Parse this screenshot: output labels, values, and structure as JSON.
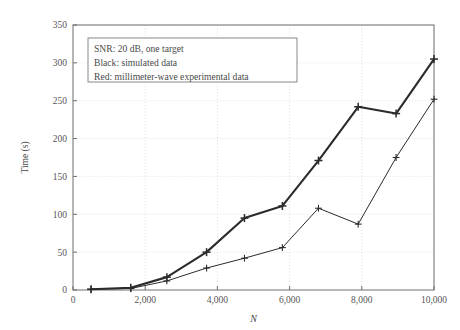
{
  "chart_data": {
    "type": "line",
    "title": "",
    "xlabel": "N",
    "ylabel": "Time (s)",
    "xlim": [
      0,
      10000
    ],
    "ylim": [
      0,
      350
    ],
    "xticks": [
      0,
      2000,
      4000,
      6000,
      8000,
      10000
    ],
    "xticklabels": [
      "0",
      "2,000",
      "4,000",
      "6,000",
      "8,000",
      "10,000"
    ],
    "yticks": [
      0,
      50,
      100,
      150,
      200,
      250,
      300,
      350
    ],
    "yticklabels": [
      "0",
      "50",
      "100",
      "150",
      "200",
      "250",
      "300",
      "350"
    ],
    "grid": true,
    "grid_style": "dotted",
    "grid_color": "#cfcfcf",
    "legend_position": "upper-left-inset",
    "marker": "plus",
    "series": [
      {
        "name": "simulated data",
        "color": "#2b2b2b",
        "linewidth": 2.1,
        "x": [
          500,
          1600,
          2600,
          3700,
          4750,
          5800,
          6800,
          7900,
          8950,
          10000
        ],
        "y": [
          1,
          3,
          17,
          50,
          95,
          111,
          171,
          242,
          233,
          305
        ]
      },
      {
        "name": "millimeter-wave experimental data",
        "color": "#2b2b2b",
        "linewidth": 1.0,
        "x": [
          500,
          1600,
          2600,
          3700,
          4750,
          5800,
          6800,
          7900,
          8950,
          10000
        ],
        "y": [
          1,
          2,
          12,
          29,
          42,
          56,
          108,
          87,
          175,
          252
        ]
      }
    ],
    "annotations": {
      "legend_box": {
        "lines": [
          "SNR: 20 dB, one target",
          "Black: simulated data",
          "Red: millimeter-wave experimental data"
        ],
        "border_color": "#7a7a7a",
        "background": "#ffffff"
      }
    }
  },
  "axes": {
    "frame_color": "#6e6e6e",
    "tick_color": "#6e6e6e"
  }
}
